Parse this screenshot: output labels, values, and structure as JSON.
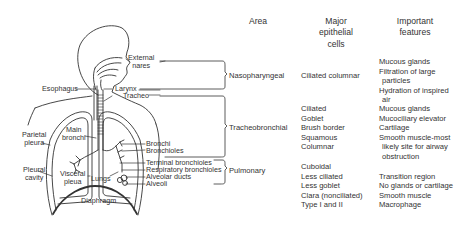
{
  "headers": {
    "area": "Area",
    "cells": [
      "Major",
      "epithelial",
      "cells"
    ],
    "features": [
      "Important",
      "features"
    ]
  },
  "anatomy_labels": {
    "external_nares": [
      "External",
      "nares"
    ],
    "esophagus": "Esophagus",
    "larynx": "Larynx",
    "tracheo": "Tracheo",
    "main_bronchi": [
      "Main",
      "bronchi"
    ],
    "parietal_pleura": [
      "Parietal",
      "pleura"
    ],
    "pleural_cavity": [
      "Pleural",
      "cavity"
    ],
    "visceral_pleura": [
      "Visceral",
      "pleua"
    ],
    "lungs": "Lungs",
    "diaphragm": "Diaphragm",
    "bronchi": "Bronchi",
    "bronchioles": "Bronchioles",
    "terminal_bronchioles": "Terminal bronchioles",
    "respiratory_bronchioles": "Respiratory bronchioles",
    "alveolar_ducts": "Alveolar ducts",
    "alveoli": "Alveoli"
  },
  "rows": [
    {
      "area": "Nasopharyngeal",
      "cells": [
        "Ciliated columnar"
      ],
      "features": [
        "Mucous glands",
        "Filtration of large",
        " particles",
        "Hydration of inspired",
        " air"
      ]
    },
    {
      "area": "Tracheobronchial",
      "cells": [
        "Ciliated",
        "Goblet",
        "Brush border",
        "Squamous",
        "Columnar"
      ],
      "features": [
        "Mucous glands",
        "Mucociliary elevator",
        "Cartilage",
        "Smooth muscle-most",
        " likely site for airway",
        " obstruction"
      ]
    },
    {
      "area": "Pulmonary",
      "cells": [
        "Cuboidal",
        "Less ciliated",
        "Less goblet",
        "Clara (nonciliated)",
        "Type I and II"
      ],
      "features": [
        "",
        "Transition region",
        "No glands or cartilage",
        "Smooth muscle",
        "Macrophage"
      ]
    }
  ]
}
